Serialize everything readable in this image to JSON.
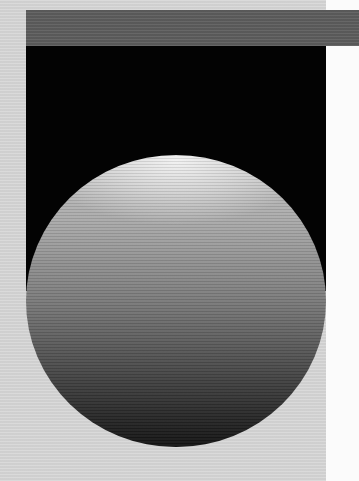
{
  "graphic": {
    "description": "Scanned abstract graphic: gray band over black panel with a shaded sphere",
    "colors": {
      "background": "#d6d6d6",
      "right_strip": "#fbfbfb",
      "top_bar": "#5e5e5e",
      "panel": "#030303",
      "sphere_highlight": "#e6e6e6",
      "sphere_shadow": "#121212"
    }
  }
}
